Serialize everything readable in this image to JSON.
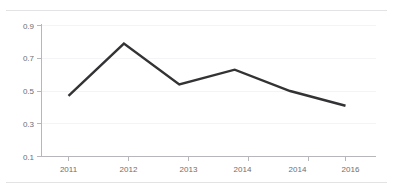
{
  "figure": {
    "title": "",
    "background_color": "#ffffff",
    "rule_color": "#e3e3e5"
  },
  "chart_data": {
    "type": "line",
    "title": "",
    "subtitle": "",
    "xlabel": "",
    "ylabel": "",
    "categories": [
      "2011",
      "2012",
      "2013",
      "2014",
      "2014",
      "2016"
    ],
    "values": [
      0.47,
      0.79,
      0.54,
      0.63,
      0.5,
      0.41
    ],
    "series": [
      {
        "name": "",
        "values": [
          0.47,
          0.79,
          0.54,
          0.63,
          0.5,
          0.41
        ],
        "color": "#333335",
        "line_width": 2.4,
        "markers": "none"
      }
    ],
    "ylim": [
      0.1,
      0.9
    ],
    "yticks": [
      0.1,
      0.3,
      0.5,
      0.7,
      0.9
    ],
    "ytick_labels": [
      "0.1",
      "0.3",
      "0.5",
      "0.7",
      "0.9"
    ],
    "xtick_labels": [
      "2011",
      "2012",
      "2013",
      "2014",
      "2014",
      "2016"
    ],
    "grid": "faint-horizontal",
    "legend": "none",
    "annotations": []
  },
  "axes": {
    "y_axis_color": "#b6b6bb",
    "x_axis_color": "#b6b6bb",
    "tick_label_color": "#6d6d72"
  }
}
